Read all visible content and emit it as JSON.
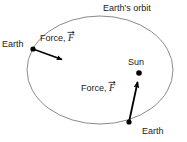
{
  "figure": {
    "title_label": "Earth's orbit",
    "orbit": {
      "name": "earth-orbit-ellipse",
      "cx": 100,
      "cy": 70,
      "rx": 73,
      "ry": 54,
      "stroke": "#8a8a8a",
      "stroke_width": 1
    },
    "bodies": [
      {
        "id": "earth-left",
        "label": "Earth",
        "x": 33,
        "y": 49,
        "r": 2.6,
        "color": "#000000"
      },
      {
        "id": "sun",
        "label": "Sun",
        "x": 139,
        "y": 73,
        "r": 2.8,
        "color": "#000000"
      },
      {
        "id": "earth-bottom",
        "label": "Earth",
        "x": 129,
        "y": 122,
        "r": 2.6,
        "color": "#000000"
      }
    ],
    "force_vectors": [
      {
        "id": "force-left",
        "label_text": "Force, ",
        "symbol": "F",
        "from_x": 33,
        "from_y": 49,
        "to_x": 64,
        "to_y": 60,
        "color": "#000000",
        "stroke_width": 1.6
      },
      {
        "id": "force-bottom",
        "label_text": "Force, ",
        "symbol": "F",
        "from_x": 129,
        "from_y": 122,
        "to_x": 138,
        "to_y": 80,
        "color": "#000000",
        "stroke_width": 1.8
      }
    ],
    "background": "#ffffff"
  }
}
